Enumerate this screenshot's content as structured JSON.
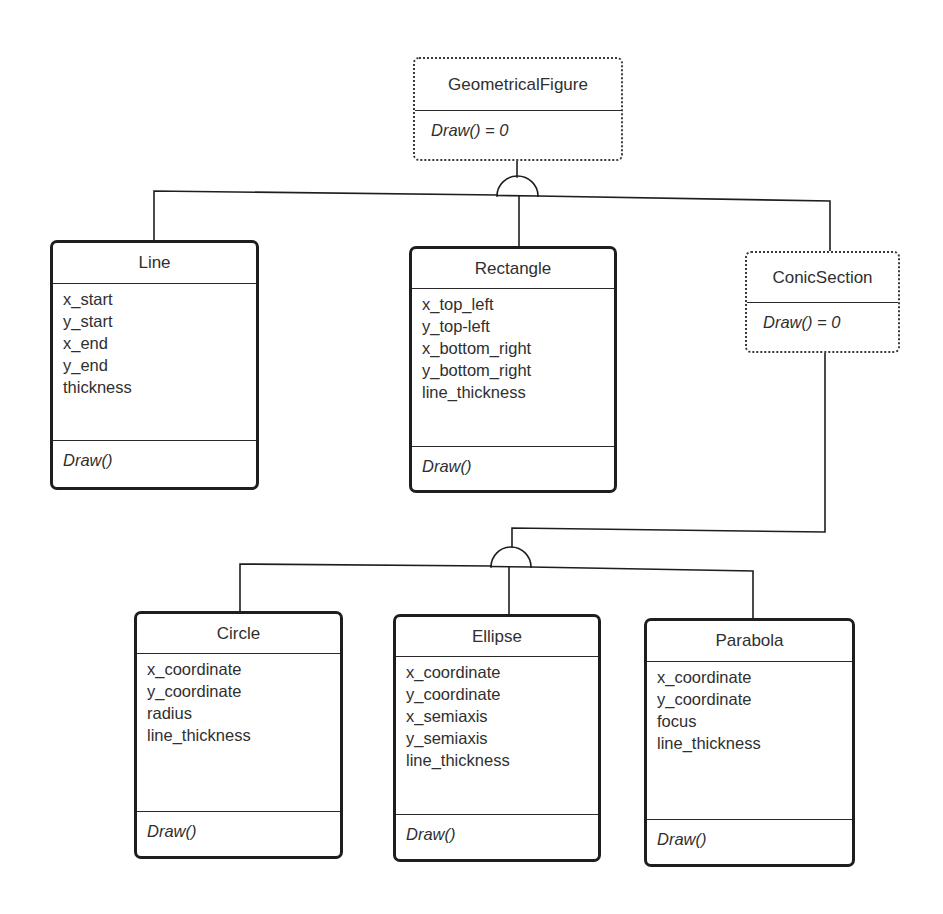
{
  "diagram": {
    "type": "UML class diagram",
    "classes": {
      "geometrical_figure": {
        "name": "GeometricalFigure",
        "abstract": true,
        "attributes": [],
        "methods": [
          "Draw() = 0"
        ]
      },
      "line": {
        "name": "Line",
        "abstract": false,
        "attributes": [
          "x_start",
          "y_start",
          "x_end",
          "y_end",
          "thickness"
        ],
        "methods": [
          "Draw()"
        ]
      },
      "rectangle": {
        "name": "Rectangle",
        "abstract": false,
        "attributes": [
          "x_top_left",
          "y_top-left",
          "x_bottom_right",
          "y_bottom_right",
          "line_thickness"
        ],
        "methods": [
          "Draw()"
        ]
      },
      "conic_section": {
        "name": "ConicSection",
        "abstract": true,
        "attributes": [],
        "methods": [
          "Draw() = 0"
        ]
      },
      "circle": {
        "name": "Circle",
        "abstract": false,
        "attributes": [
          "x_coordinate",
          "y_coordinate",
          "radius",
          "line_thickness"
        ],
        "methods": [
          "Draw()"
        ]
      },
      "ellipse": {
        "name": "Ellipse",
        "abstract": false,
        "attributes": [
          "x_coordinate",
          "y_coordinate",
          "x_semiaxis",
          "y_semiaxis",
          "line_thickness"
        ],
        "methods": [
          "Draw()"
        ]
      },
      "parabola": {
        "name": "Parabola",
        "abstract": false,
        "attributes": [
          "x_coordinate",
          "y_coordinate",
          "focus",
          "line_thickness"
        ],
        "methods": [
          "Draw()"
        ]
      }
    },
    "inheritance": [
      {
        "parent": "GeometricalFigure",
        "children": [
          "Line",
          "Rectangle",
          "ConicSection"
        ]
      },
      {
        "parent": "ConicSection",
        "children": [
          "Circle",
          "Ellipse",
          "Parabola"
        ]
      }
    ],
    "colors": {
      "line": "#1e1e1e",
      "text": "#2f2f2f",
      "background": "#ffffff"
    }
  }
}
